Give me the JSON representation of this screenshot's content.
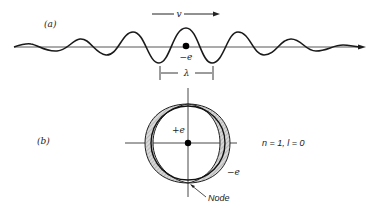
{
  "panel_a": {
    "label": "(a)",
    "velocity_label": "v",
    "charge_label": "−e",
    "wavelength_label": "λ"
  },
  "panel_b": {
    "label": "(b)",
    "nucleus_label": "+e",
    "electron_label": "−e",
    "quantum_numbers": "n = 1, l = 0",
    "node_label": "Node"
  }
}
